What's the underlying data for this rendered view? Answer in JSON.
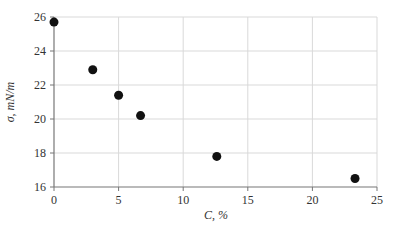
{
  "chart_data": {
    "type": "scatter",
    "title": "",
    "xlabel": "C, %",
    "ylabel": "σ, mN/m",
    "xlim": [
      0,
      25
    ],
    "ylim": [
      16,
      26
    ],
    "x_ticks": [
      0,
      5,
      10,
      15,
      20,
      25
    ],
    "y_ticks": [
      16,
      18,
      20,
      22,
      24,
      26
    ],
    "grid": true,
    "legend": null,
    "series": [
      {
        "name": "σ vs C",
        "marker": "circle",
        "color": "#111111",
        "points": [
          {
            "x": 0.0,
            "y": 25.7
          },
          {
            "x": 3.0,
            "y": 22.9
          },
          {
            "x": 5.0,
            "y": 21.4
          },
          {
            "x": 6.7,
            "y": 20.2
          },
          {
            "x": 12.6,
            "y": 17.8
          },
          {
            "x": 23.3,
            "y": 16.5
          }
        ]
      }
    ]
  },
  "colors": {
    "grid": "#d9d9d9",
    "axis": "#777777",
    "marker": "#111111",
    "text": "#333333"
  }
}
